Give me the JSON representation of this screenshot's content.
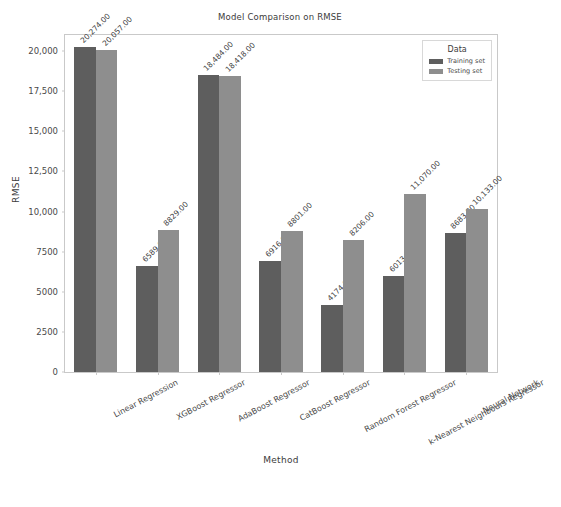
{
  "chart_data": {
    "type": "bar",
    "title": "Model Comparison on RMSE",
    "xlabel": "Method",
    "ylabel": "RMSE",
    "ylim": [
      0,
      21000
    ],
    "grid": false,
    "legend_title": "Data",
    "legend_position": "upper right",
    "ytick_labels": [
      "0",
      "2500",
      "5000",
      "7500",
      "10,000",
      "12,500",
      "15,000",
      "17,500",
      "20,000"
    ],
    "ytick_values": [
      0,
      2500,
      5000,
      7500,
      10000,
      12500,
      15000,
      17500,
      20000
    ],
    "categories": [
      "Linear Regression",
      "XGBoost Regressor",
      "AdaBoost Regressor",
      "CatBoost Regressor",
      "Random Forest Regressor",
      "k-Nearest Neighbours Regressor",
      "Neural Network"
    ],
    "series": [
      {
        "name": "Training set",
        "color": "#5e5e5e",
        "values": [
          20274,
          6589,
          18484,
          6916,
          4174,
          6013,
          8683
        ],
        "labels": [
          "20,274.00",
          "6589.00",
          "18,484.00",
          "6916.00",
          "4174.00",
          "6013.00",
          "8683.00"
        ]
      },
      {
        "name": "Testing set",
        "color": "#8e8e8e",
        "values": [
          20057,
          8829,
          18418,
          8801,
          8206,
          11070,
          10133
        ],
        "labels": [
          "20,057.00",
          "8829.00",
          "18,418.00",
          "8801.00",
          "8206.00",
          "11,070.00",
          "10,133.00"
        ]
      }
    ]
  }
}
